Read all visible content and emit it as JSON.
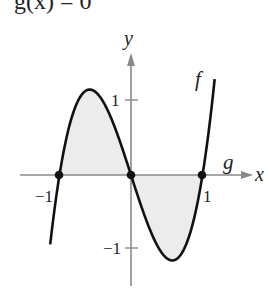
{
  "caption": "g(x) = 0",
  "chart_data": {
    "type": "line",
    "title": "",
    "function_label": "f",
    "baseline_label": "g",
    "xlabel": "x",
    "ylabel": "y",
    "x_ticks": [
      {
        "value": -1,
        "label": "−1"
      },
      {
        "value": 1,
        "label": "1"
      }
    ],
    "y_ticks": [
      {
        "value": 1,
        "label": "1"
      },
      {
        "value": -1,
        "label": "−1"
      }
    ],
    "xlim": [
      -1.55,
      1.7
    ],
    "ylim": [
      -1.5,
      1.65
    ],
    "series": [
      {
        "name": "f",
        "formula": "f(x) = 3x^3 - 3x",
        "x": [
          -1.13,
          -1.0,
          -0.8,
          -0.577,
          -0.4,
          -0.2,
          0,
          0.2,
          0.4,
          0.577,
          0.8,
          1.0,
          1.17
        ],
        "values": [
          -0.94,
          0,
          0.86,
          1.15,
          1.01,
          0.58,
          0,
          -0.58,
          -1.01,
          -1.15,
          -0.86,
          0,
          1.29
        ]
      },
      {
        "name": "g",
        "formula": "g(x) = 0",
        "x": [
          -1.55,
          1.7
        ],
        "values": [
          0,
          0
        ]
      }
    ],
    "intersection_points": [
      {
        "x": -1,
        "y": 0
      },
      {
        "x": 0,
        "y": 0
      },
      {
        "x": 1,
        "y": 0
      }
    ],
    "shaded_regions": [
      {
        "from": -1,
        "to": 0,
        "between": [
          "f",
          "g"
        ],
        "color": "#ececec"
      },
      {
        "from": 0,
        "to": 1,
        "between": [
          "g",
          "f"
        ],
        "color": "#ececec"
      }
    ],
    "grid": false,
    "legend": "none"
  },
  "colors": {
    "curve": "#111111",
    "axis": "#8a8a8a",
    "shade": "#ececec",
    "point": "#111111"
  }
}
